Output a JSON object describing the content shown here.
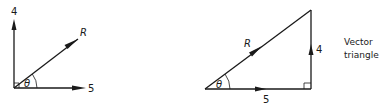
{
  "left_diagram": {
    "vertical_label": "4",
    "horizontal_label": "5",
    "resultant_label": "R",
    "angle_label": "θ"
  },
  "right_diagram": {
    "base_label": "5",
    "side_label": "4",
    "hypotenuse_label": "R",
    "angle_label": "θ",
    "caption_line1": "Vector",
    "caption_line2": "triangle"
  },
  "colors": {
    "stroke": "#1a1a1a",
    "background": "#ffffff"
  }
}
